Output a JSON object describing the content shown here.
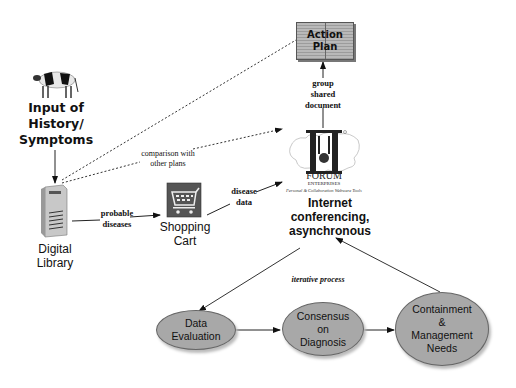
{
  "diagram": {
    "nodes": {
      "input": {
        "label_line1": "Input of",
        "label_line2": "History/",
        "label_line3": "Symptoms",
        "icon": "cow-icon"
      },
      "library": {
        "label_line1": "Digital",
        "label_line2": "Library",
        "icon": "server-tower-icon"
      },
      "cart": {
        "label_line1": "Shopping",
        "label_line2": "Cart",
        "icon": "shopping-cart-icon"
      },
      "action_plan": {
        "label_line1": "Action",
        "label_line2": "Plan",
        "icon": "open-book-icon"
      },
      "forum": {
        "logo_text": "FORUM",
        "logo_subtext": "ENTERPRISES",
        "tagline": "Personal & Collaboration Webware Tools",
        "icon": "forum-logo-icon"
      },
      "internet": {
        "label_line1": "Internet",
        "label_line2": "conferencing,",
        "label_line3": "asynchronous"
      },
      "data_eval": {
        "label_line1": "Data",
        "label_line2": "Evaluation"
      },
      "consensus": {
        "label_line1": "Consensus",
        "label_line2": "on",
        "label_line3": "Diagnosis"
      },
      "containment": {
        "label_line1": "Containment",
        "label_line2": "&",
        "label_line3": "Management",
        "label_line4": "Needs"
      }
    },
    "edge_labels": {
      "probable_line1": "probable",
      "probable_line2": "diseases",
      "disease_line1": "disease",
      "disease_line2": "data",
      "group_line1": "group",
      "group_line2": "shared",
      "group_line3": "document",
      "comparison_line1": "comparison with",
      "comparison_line2": "other plans",
      "iterative": "iterative process"
    },
    "colors": {
      "ellipse_fill": "#a8a8a8",
      "line": "#333333",
      "background": "#ffffff"
    }
  }
}
